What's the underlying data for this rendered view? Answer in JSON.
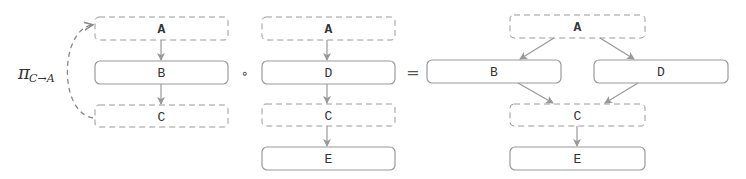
{
  "colors": {
    "border": "#9a9a9a",
    "arrow": "#999999",
    "text": "#333333"
  },
  "operator_left": {
    "symbol": "π",
    "subscript": "C→A"
  },
  "compose_operator": "∘",
  "equals_operator": "=",
  "panels": [
    {
      "id": "projection",
      "nodes": [
        {
          "label": "A",
          "style": "dashed"
        },
        {
          "label": "B",
          "style": "solid"
        },
        {
          "label": "C",
          "style": "dashed"
        }
      ],
      "edges": [
        [
          "A",
          "B"
        ],
        [
          "B",
          "C"
        ]
      ],
      "curved_edge": [
        "C",
        "A"
      ]
    },
    {
      "id": "chain",
      "nodes": [
        {
          "label": "A",
          "style": "dashed"
        },
        {
          "label": "D",
          "style": "solid"
        },
        {
          "label": "C",
          "style": "dashed"
        },
        {
          "label": "E",
          "style": "solid"
        }
      ],
      "edges": [
        [
          "A",
          "D"
        ],
        [
          "D",
          "C"
        ],
        [
          "C",
          "E"
        ]
      ]
    },
    {
      "id": "result",
      "nodes": [
        {
          "label": "A",
          "style": "dashed"
        },
        {
          "label": "B",
          "style": "solid"
        },
        {
          "label": "D",
          "style": "solid"
        },
        {
          "label": "C",
          "style": "dashed"
        },
        {
          "label": "E",
          "style": "solid"
        }
      ],
      "edges": [
        [
          "A",
          "B"
        ],
        [
          "A",
          "D"
        ],
        [
          "B",
          "C"
        ],
        [
          "D",
          "C"
        ],
        [
          "C",
          "E"
        ]
      ]
    }
  ]
}
